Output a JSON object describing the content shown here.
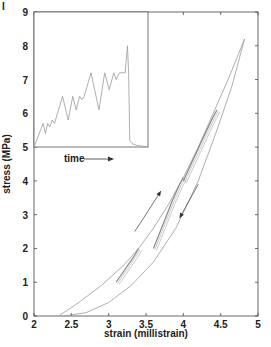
{
  "panel_label": "I",
  "chart_data": {
    "type": "line",
    "title": "",
    "xlabel": "strain  (millistrain)",
    "ylabel": "stress  (MPa)",
    "xlim": [
      2,
      5
    ],
    "ylim": [
      0,
      9
    ],
    "xticks": [
      "2",
      "2.5",
      "3",
      "3.5",
      "4",
      "4.5",
      "5"
    ],
    "yticks": [
      "0",
      "1",
      "2",
      "3",
      "4",
      "5",
      "6",
      "7",
      "8",
      "9"
    ],
    "grid": false,
    "legend": null,
    "series": [
      {
        "name": "loading envelope (upper)",
        "x": [
          2.33,
          2.6,
          2.9,
          3.2,
          3.4,
          3.6,
          3.8,
          4.0,
          4.2,
          4.4,
          4.6,
          4.82
        ],
        "y": [
          0.0,
          0.4,
          0.9,
          1.5,
          2.0,
          2.6,
          3.3,
          4.1,
          5.0,
          6.0,
          7.0,
          8.2
        ]
      },
      {
        "name": "unloading envelope (lower)",
        "x": [
          2.4,
          2.7,
          3.0,
          3.3,
          3.6,
          3.9,
          4.2,
          4.45,
          4.65,
          4.82
        ],
        "y": [
          0.0,
          0.1,
          0.4,
          0.9,
          1.6,
          2.6,
          4.0,
          5.5,
          6.8,
          8.2
        ]
      },
      {
        "name": "minor loops ~2 MPa",
        "x": [
          3.1,
          3.35,
          3.4
        ],
        "y": [
          1.0,
          1.8,
          2.0
        ]
      },
      {
        "name": "minor loops ~4 MPa",
        "x": [
          3.6,
          3.85,
          3.95,
          4.0
        ],
        "y": [
          2.0,
          3.4,
          3.9,
          4.1
        ]
      },
      {
        "name": "minor loops ~6 MPa",
        "x": [
          4.0,
          4.25,
          4.4,
          4.45
        ],
        "y": [
          4.0,
          5.2,
          5.9,
          6.1
        ]
      }
    ],
    "annotations": [
      {
        "type": "arrow",
        "direction": "up-right",
        "from": [
          3.35,
          2.5
        ],
        "to": [
          3.7,
          3.7
        ],
        "meaning": "loading"
      },
      {
        "type": "arrow",
        "direction": "down-left",
        "from": [
          4.2,
          3.9
        ],
        "to": [
          3.95,
          2.9
        ],
        "meaning": "unloading"
      }
    ],
    "inset": {
      "xlabel": "time",
      "ylim": [
        5,
        9
      ],
      "description": "stress vs time sawtooth rising from 5 to ~8 MPa then dropping to ~5",
      "x": [
        0,
        8,
        10,
        12,
        14,
        16,
        18,
        25,
        30,
        34,
        37,
        40,
        42,
        44,
        50,
        57,
        62,
        66,
        70,
        72,
        75,
        80,
        82,
        83,
        84,
        86,
        90,
        100
      ],
      "y": [
        5.0,
        5.7,
        5.4,
        5.7,
        5.6,
        5.8,
        5.7,
        6.5,
        5.8,
        6.5,
        6.1,
        6.5,
        6.4,
        6.5,
        7.2,
        6.1,
        7.2,
        6.7,
        7.2,
        7.0,
        7.2,
        7.2,
        8.0,
        7.2,
        5.2,
        5.1,
        5.05,
        5.0
      ]
    }
  }
}
